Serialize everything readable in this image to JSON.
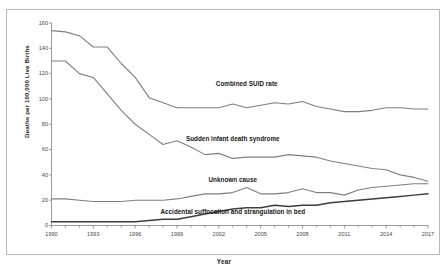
{
  "chart_data": {
    "type": "line",
    "title": "",
    "xlabel": "Year",
    "ylabel": "Deaths per 100,000 Live Births",
    "xlim": [
      1990,
      2017
    ],
    "ylim": [
      0,
      160
    ],
    "yticks": [
      0,
      20,
      40,
      60,
      80,
      100,
      120,
      140,
      160
    ],
    "xticks": [
      1990,
      1993,
      1996,
      1999,
      2002,
      2005,
      2008,
      2011,
      2014,
      2017
    ],
    "grid": false,
    "legend": "inline-labels",
    "x": [
      1990,
      1991,
      1992,
      1993,
      1994,
      1995,
      1996,
      1997,
      1998,
      1999,
      2000,
      2001,
      2002,
      2003,
      2004,
      2005,
      2006,
      2007,
      2008,
      2009,
      2010,
      2011,
      2012,
      2013,
      2014,
      2015,
      2016,
      2017
    ],
    "series": [
      {
        "name": "Combined SUID rate",
        "color": "#7f7f7f",
        "values": [
          154,
          153,
          150,
          141,
          141,
          128,
          117,
          101,
          97,
          93,
          93,
          93,
          93,
          96,
          93,
          95,
          97,
          96,
          98,
          94,
          92,
          90,
          90,
          91,
          93,
          93,
          92,
          92
        ]
      },
      {
        "name": "Sudden infant death syndrome",
        "color": "#7f7f7f",
        "values": [
          130,
          130,
          120,
          117,
          104,
          91,
          80,
          72,
          64,
          67,
          62,
          56,
          57,
          53,
          54,
          54,
          54,
          56,
          55,
          54,
          51,
          49,
          47,
          45,
          44,
          40,
          38,
          35
        ]
      },
      {
        "name": "Unknown cause",
        "color": "#7f7f7f",
        "values": [
          21,
          21,
          20,
          19,
          19,
          19,
          20,
          20,
          20,
          21,
          23,
          25,
          25,
          26,
          30,
          25,
          25,
          26,
          29,
          26,
          26,
          24,
          28,
          30,
          31,
          32,
          33,
          33
        ]
      },
      {
        "name": "Accidental suffocation and strangulation in bed",
        "color": "#3d3d3d",
        "values": [
          3,
          3,
          3,
          3,
          3,
          3,
          3,
          4,
          5,
          5,
          7,
          9,
          11,
          13,
          14,
          14,
          16,
          15,
          16,
          16,
          18,
          19,
          20,
          21,
          22,
          23,
          24,
          25
        ]
      }
    ],
    "annotations": [
      {
        "text": "Combined SUID rate",
        "x": 2004,
        "y": 112
      },
      {
        "text": "Sudden infant death syndrome",
        "x": 2003,
        "y": 68
      },
      {
        "text": "Unknown cause",
        "x": 2003,
        "y": 36
      },
      {
        "text": "Accidental suffocation and strangulation in bed",
        "x": 2003,
        "y": 11
      }
    ]
  },
  "axes": {
    "y_title": "Deaths per 100,000 Live Births",
    "x_title": "Year",
    "y_tick_labels": [
      "0",
      "20",
      "40",
      "60",
      "80",
      "100",
      "120",
      "140",
      "160"
    ],
    "x_tick_labels": [
      "1990",
      "1993",
      "1996",
      "1999",
      "2002",
      "2005",
      "2008",
      "2011",
      "2014",
      "2017"
    ]
  },
  "labels": {
    "combined": "Combined SUID rate",
    "sids": "Sudden infant death syndrome",
    "unknown": "Unknown cause",
    "suffocation": "Accidental suffocation and strangulation in bed"
  }
}
